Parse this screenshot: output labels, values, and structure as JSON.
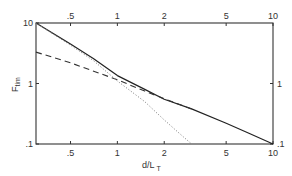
{
  "chart_data": {
    "type": "line",
    "title": "",
    "xlabel": "d/L_T",
    "ylabel": "F_tim",
    "xscale": "log",
    "yscale": "log",
    "xlim": [
      0.3,
      10
    ],
    "ylim": [
      0.1,
      10
    ],
    "x_ticks": [
      0.5,
      1,
      2,
      5,
      10
    ],
    "x_tick_labels": [
      ".5",
      "1",
      "2",
      "5",
      "10"
    ],
    "y_ticks": [
      10,
      1,
      0.1
    ],
    "y_tick_labels": [
      "10",
      "1",
      ".1"
    ],
    "right_y_tick_labels": [
      "1",
      ".1"
    ],
    "top_x_tick_labels": [
      ".5",
      "1",
      "2",
      "5",
      "10"
    ],
    "grid": false,
    "legend": null,
    "series": [
      {
        "name": "solid",
        "style": "solid",
        "x": [
          0.3,
          0.5,
          0.7,
          1,
          1.5,
          2,
          3,
          5,
          7,
          10
        ],
        "y": [
          10,
          4.5,
          2.6,
          1.35,
          0.8,
          0.55,
          0.38,
          0.22,
          0.15,
          0.1
        ]
      },
      {
        "name": "dashed",
        "style": "dashed",
        "x": [
          0.3,
          0.5,
          1,
          1.5,
          2,
          3
        ],
        "y": [
          3.3,
          2.2,
          1.15,
          0.75,
          0.56,
          0.38
        ]
      },
      {
        "name": "dotted",
        "style": "dotted",
        "x": [
          0.3,
          0.5,
          0.7,
          1,
          1.5,
          2,
          2.5,
          3
        ],
        "y": [
          10,
          4.3,
          2.4,
          1.1,
          0.5,
          0.25,
          0.15,
          0.1
        ]
      }
    ]
  },
  "labels": {
    "xlabel_main": "d/L",
    "xlabel_sub": "T",
    "ylabel_main": "F",
    "ylabel_sub": "tim"
  }
}
